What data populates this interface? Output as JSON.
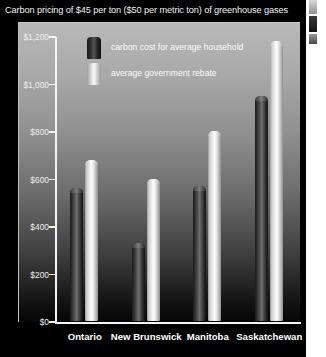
{
  "chart_data": {
    "type": "bar",
    "title": "Carbon pricing of $45 per ton ($50 per metric ton) of greenhouse gases",
    "xlabel": "",
    "ylabel": "",
    "ylim": [
      0,
      1200
    ],
    "yticks": [
      0,
      200,
      400,
      600,
      800,
      1000,
      1200
    ],
    "ytick_labels": [
      "$0",
      "$200",
      "$400",
      "$600",
      "$800",
      "$1,000",
      "$1,200"
    ],
    "grid": false,
    "legend_position": "upper-left-inside",
    "categories": [
      "Ontario",
      "New Brunswick",
      "Manitoba",
      "Saskatchewan"
    ],
    "series": [
      {
        "name": "carbon cost for average household",
        "key": "cost",
        "color": "#3c3c3c",
        "values": [
          560,
          330,
          570,
          946
        ]
      },
      {
        "name": "average government rebate",
        "key": "rebate",
        "color": "#f2f2f2",
        "values": [
          680,
          600,
          800,
          1180
        ]
      }
    ]
  },
  "colors": {
    "background": "#000000",
    "title_text": "#f2f2f2",
    "axis": "#f4f4f4",
    "cost_bar": "#3c3c3c",
    "rebate_bar": "#f2f2f2",
    "panel_top": "#b9b9b9",
    "panel_bottom": "#050505"
  }
}
